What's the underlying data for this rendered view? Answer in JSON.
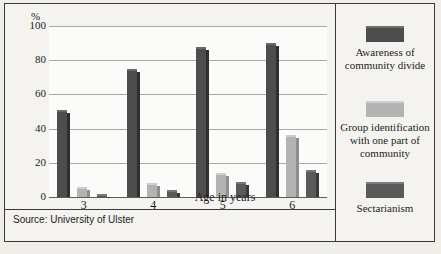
{
  "chart_data": {
    "type": "bar",
    "title": "",
    "subtitle": "",
    "xlabel": "Age in years",
    "ylabel": "%",
    "ylim": [
      0,
      100
    ],
    "yticks": [
      0,
      20,
      40,
      60,
      80,
      100
    ],
    "grid": true,
    "legend_position": "right",
    "categories": [
      "3",
      "4",
      "5",
      "6"
    ],
    "series": [
      {
        "name": "Awareness of community divide",
        "color": "#4d4d4d",
        "values": [
          51,
          75,
          88,
          90
        ]
      },
      {
        "name": "Group identification with one part of community",
        "color": "#b3b3b3",
        "values": [
          6,
          8,
          14,
          36
        ]
      },
      {
        "name": "Sectarianism",
        "color": "#5a5a5a",
        "values": [
          2,
          4,
          9,
          16
        ]
      }
    ],
    "source_note": "Source: University of Ulster"
  },
  "axis": {
    "unit_label": "%",
    "y_tick_labels": [
      "100",
      "80",
      "60",
      "40",
      "20",
      "0"
    ],
    "x_tick_labels": [
      "3",
      "4",
      "5",
      "6"
    ],
    "x_axis_title": "Age in years"
  },
  "legend": {
    "items": [
      {
        "swatch": "dark-swatch",
        "label": "Awareness of\ncommunity divide"
      },
      {
        "swatch": "light-swatch",
        "label": "Group identification\nwith one part of\ncommunity"
      },
      {
        "swatch": "mid-swatch",
        "label": "Sectarianism"
      }
    ],
    "item_0_label": "Awareness of community divide",
    "item_1_label": "Group identification with one part of community",
    "item_2_label": "Sectarianism"
  },
  "source": {
    "text": "Source: University of Ulster"
  },
  "caption": {
    "text": ""
  }
}
